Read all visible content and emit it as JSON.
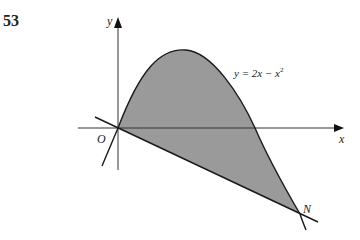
{
  "question_number": "53",
  "diagram": {
    "axis_labels": {
      "x": "x",
      "y": "y"
    },
    "origin_label": "O",
    "point_label": "N",
    "curve_label": "y = 2x − x²",
    "curve_label_parts": {
      "lhs": "y = 2x − x",
      "exp": "2"
    },
    "colors": {
      "shade": "#9a9a9a",
      "stroke": "#1a1a1a",
      "axis": "#333333"
    }
  }
}
